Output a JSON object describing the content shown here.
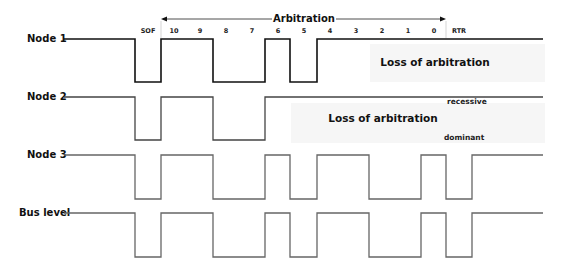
{
  "diagram": {
    "arbitration_label": "Arbitration",
    "bit_labels": [
      "SOF",
      "10",
      "9",
      "8",
      "7",
      "6",
      "5",
      "4",
      "3",
      "2",
      "1",
      "0",
      "RTR"
    ],
    "bit_label_x": [
      148,
      174,
      200,
      226,
      252,
      278,
      304,
      330,
      356,
      382,
      408,
      434,
      459
    ],
    "nodes": [
      {
        "label": "Node 1",
        "color": "#111111",
        "high_y": 39,
        "low_y": 82,
        "points": "64,39 135,39 135,82 161,82 161,39 213,39 213,82 265,82 265,39 290,39 290,82 317,82 317,39 543,39"
      },
      {
        "label": "Node 2",
        "color": "#444444",
        "high_y": 97,
        "low_y": 140,
        "points": "64,97 135,97 135,140 161,140 161,97 213,97 213,140 265,140 265,97 543,97"
      },
      {
        "label": "Node 3",
        "color": "#666666",
        "high_y": 155,
        "low_y": 199,
        "points": "64,155 135,155 135,199 161,199 161,155 213,155 213,199 265,199 265,155 290,155 290,199 317,199 317,155 369,155 369,199 421,199 421,155 446,155 446,199 472,199 472,155 543,155"
      },
      {
        "label": "Bus level",
        "color": "#666666",
        "high_y": 213,
        "low_y": 257,
        "points": "64,213 135,213 135,257 161,257 161,213 213,213 213,257 265,257 265,213 290,213 290,257 317,257 317,213 369,213 369,257 421,257 421,213 446,213 446,257 472,257 472,213 543,213"
      }
    ],
    "annotations": {
      "node1_loss": "Loss of arbitration",
      "node2_loss": "Loss of arbitration",
      "recessive": "recessive",
      "dominant": "dominant"
    }
  }
}
